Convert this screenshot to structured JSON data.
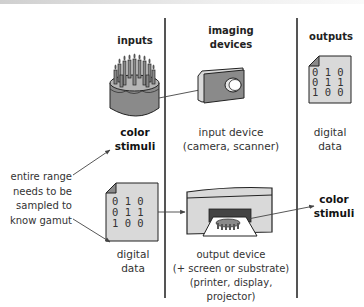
{
  "columns": {
    "inputs": {
      "header": "inputs"
    },
    "devices": {
      "header_line1": "imaging",
      "header_line2": "devices"
    },
    "outputs": {
      "header": "outputs"
    }
  },
  "top_row": {
    "input_label_line1": "color",
    "input_label_line2": "stimuli",
    "device_label_line1": "input device",
    "device_label_line2": "(camera, scanner)",
    "output_label_line1": "digital",
    "output_label_line2": "data"
  },
  "bottom_row": {
    "input_label_line1": "digital",
    "input_label_line2": "data",
    "device_label_line1": "output device",
    "device_label_line2": "(+ screen or substrate)",
    "device_label_line3": "(printer, display, projector)",
    "output_label_line1": "color",
    "output_label_line2": "stimuli"
  },
  "note": {
    "line1": "entire range",
    "line2": "needs to be",
    "line3": "sampled to",
    "line4": "know gamut"
  },
  "digital_data": {
    "row1": "0 1 0",
    "row2": "0 1 1",
    "row3": "1 0 0"
  },
  "icons": {
    "input_stimulus": "birthday-cake-icon",
    "input_device": "camera-icon",
    "output_device": "printer-icon",
    "data_document": "document-icon"
  },
  "colors": {
    "line": "#555555",
    "fill_dark": "#8a8a8a",
    "fill_mid": "#b5b5b5",
    "fill_light": "#d9d9d9"
  }
}
